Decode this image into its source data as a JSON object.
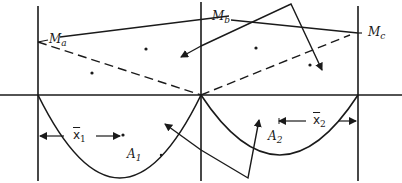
{
  "diagram": {
    "type": "moment-area diagram",
    "stroke_color": "#1a1a1a",
    "background": "#ffffff",
    "labels": {
      "Ma": {
        "main": "M",
        "sub": "a"
      },
      "Mb": {
        "main": "M",
        "sub": "b"
      },
      "Mc": {
        "main": "M",
        "sub": "c"
      },
      "A1": {
        "main": "A",
        "sub": "1"
      },
      "A2": {
        "main": "A",
        "sub": "2"
      },
      "x1": {
        "main": "x",
        "sub": "1"
      },
      "x2": {
        "main": "x",
        "sub": "2"
      }
    },
    "supports": {
      "left_x": 38,
      "middle_x": 201,
      "right_x": 358,
      "baseline_y": 95
    },
    "moments": {
      "Ma_point": [
        38,
        42
      ],
      "Mc_point": [
        358,
        33
      ],
      "support_point": [
        201,
        95
      ]
    },
    "parabolas": [
      {
        "name": "A1",
        "from": [
          38,
          95
        ],
        "to": [
          201,
          95
        ],
        "depth_y": 178
      },
      {
        "name": "A2",
        "from": [
          201,
          95
        ],
        "to": [
          358,
          95
        ],
        "depth_y": 155
      }
    ]
  }
}
